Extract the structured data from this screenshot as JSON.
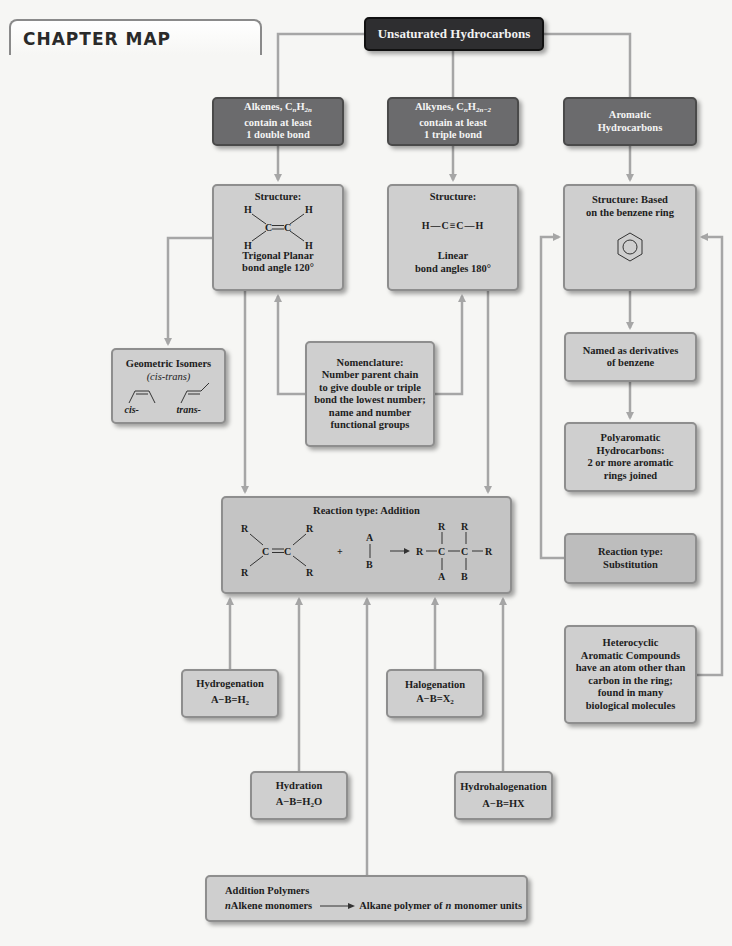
{
  "header": {
    "title": "CHAPTER MAP"
  },
  "root": {
    "label": "Unsaturated Hydrocarbons"
  },
  "colors": {
    "dark_box": "#2e2e30",
    "mid_box": "#6b6b6d",
    "light_box": "#cfcfcf",
    "connector": "#a6a6a6",
    "background": "#f6f6f4"
  },
  "categories": {
    "alkenes": {
      "line1": "Alkenes, C",
      "formula_n": "n",
      "formula_h": "H",
      "formula_sub": "2n",
      "line2": "contain at least",
      "line3": "1 double bond"
    },
    "alkynes": {
      "line1": "Alkynes, C",
      "formula_n": "n",
      "formula_h": "H",
      "formula_sub": "2n−2",
      "line2": "contain at least",
      "line3": "1 triple bond"
    },
    "aromatic": {
      "line1": "Aromatic",
      "line2": "Hydrocarbons"
    }
  },
  "structures": {
    "alkene": {
      "title": "Structure:",
      "atoms": {
        "h": "H",
        "c": "C"
      },
      "line1": "Trigonal Planar",
      "line2": "bond angle 120°"
    },
    "alkyne": {
      "title": "Structure:",
      "formula": "H—C≡C—H",
      "line1": "Linear",
      "line2": "bond angles 180°"
    },
    "aromatic": {
      "line1": "Structure: Based",
      "line2": "on the benzene ring"
    }
  },
  "geometric_isomers": {
    "title": "Geometric Isomers",
    "subtitle": "(cis-trans)",
    "cis": "cis-",
    "trans": "trans-"
  },
  "nomenclature": {
    "lines": [
      "Nomenclature:",
      "Number parent chain",
      "to give double or triple",
      "bond the lowest number;",
      "name and number",
      "functional groups"
    ]
  },
  "aromatic_branch": {
    "named": {
      "line1": "Named as derivatives",
      "line2": "of benzene"
    },
    "polyaromatic": {
      "lines": [
        "Polyaromatic",
        "Hydrocarbons:",
        "2 or more aromatic",
        "rings joined"
      ]
    },
    "substitution": {
      "line1": "Reaction type:",
      "line2": "Substitution"
    },
    "heterocyclic": {
      "lines": [
        "Heterocyclic",
        "Aromatic Compounds",
        "have an atom other than",
        "carbon in the ring;",
        "found in many",
        "biological molecules"
      ]
    }
  },
  "addition_reaction": {
    "title": "Reaction type: Addition",
    "r": "R",
    "c": "C",
    "a": "A",
    "b": "B",
    "plus": "+"
  },
  "reactions": {
    "hydrogenation": {
      "name": "Hydrogenation",
      "formula": "A−B=H",
      "sub": "2",
      "tail": ""
    },
    "halogenation": {
      "name": "Halogenation",
      "formula": "A−B=X",
      "sub": "2",
      "tail": ""
    },
    "hydration": {
      "name": "Hydration",
      "formula": "A−B=H",
      "sub": "2",
      "tail": "O"
    },
    "hydrohalogenation": {
      "name": "Hydrohalogenation",
      "formula": "A−B=HX",
      "sub": "",
      "tail": ""
    }
  },
  "addition_polymers": {
    "title": "Addition Polymers",
    "n": "n",
    "left": " Alkene monomers",
    "right_pre": "Alkane polymer of ",
    "right_n": "n",
    "right_post": " monomer units"
  }
}
